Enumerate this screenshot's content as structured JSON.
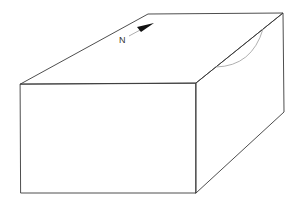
{
  "diagram": {
    "type": "block-diagram",
    "north_arrow": {
      "label": "N",
      "icon": "north-arrow-icon"
    },
    "colors": {
      "edge": "#3a3a3a",
      "arc": "#9a9a9a",
      "background": "#ffffff"
    }
  }
}
